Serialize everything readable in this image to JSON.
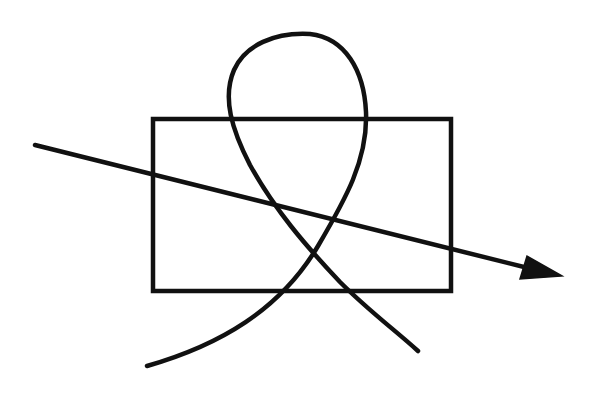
{
  "diagram": {
    "stroke_color": "#111111",
    "background_color": "#ffffff",
    "stroke_width": 4,
    "shapes": {
      "rectangle": {
        "x": 153,
        "y": 119,
        "width": 298,
        "height": 172
      },
      "arrow": {
        "start": [
          35,
          145
        ],
        "end": [
          522,
          266
        ],
        "head": {
          "tip": [
            562,
            276
          ],
          "base_a": [
            527,
            256
          ],
          "base_b": [
            520,
            279
          ]
        }
      },
      "loop_curve": {
        "start": [
          147,
          366
        ],
        "end": [
          418,
          351
        ]
      }
    },
    "labels": []
  }
}
